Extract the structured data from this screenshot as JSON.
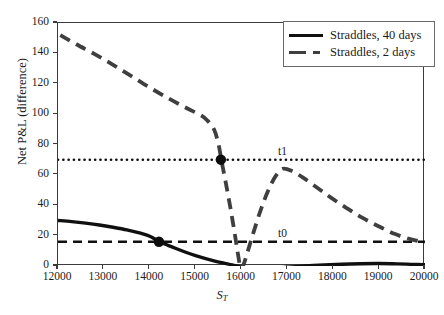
{
  "chart_data": {
    "type": "line",
    "title": "",
    "xlabel": "S_T",
    "xlabel_base": "S",
    "xlabel_sub": "T",
    "ylabel": "Net P&L (difference)",
    "xlim": [
      12000,
      20000
    ],
    "ylim": [
      0,
      160
    ],
    "xticks": [
      12000,
      13000,
      14000,
      15000,
      16000,
      17000,
      18000,
      19000,
      20000
    ],
    "yticks": [
      0,
      20,
      40,
      60,
      80,
      100,
      120,
      140,
      160
    ],
    "grid": false,
    "legend_position": "top-right",
    "series": [
      {
        "name": "Straddles, 40 days",
        "style": "solid",
        "color": "#101010",
        "width": 3.4,
        "points": [
          [
            12000,
            30.0
          ],
          [
            12300,
            29.2
          ],
          [
            12600,
            28.2
          ],
          [
            12900,
            27.0
          ],
          [
            13200,
            25.5
          ],
          [
            13500,
            23.8
          ],
          [
            13800,
            21.6
          ],
          [
            14000,
            19.6
          ],
          [
            14200,
            16.2
          ],
          [
            14400,
            13.6
          ],
          [
            14600,
            11.2
          ],
          [
            14800,
            8.9
          ],
          [
            15000,
            6.8
          ],
          [
            15200,
            5.0
          ],
          [
            15400,
            3.4
          ],
          [
            15600,
            2.0
          ],
          [
            15800,
            0.7
          ],
          [
            16000,
            -0.8
          ],
          [
            16200,
            -1.6
          ],
          [
            16400,
            -1.9
          ],
          [
            16600,
            -1.7
          ],
          [
            16800,
            -1.3
          ],
          [
            17000,
            -0.8
          ],
          [
            17400,
            0.0
          ],
          [
            17800,
            0.7
          ],
          [
            18200,
            1.2
          ],
          [
            18600,
            1.5
          ],
          [
            19000,
            1.6
          ],
          [
            19400,
            1.4
          ],
          [
            19700,
            1.1
          ],
          [
            20000,
            0.8
          ]
        ]
      },
      {
        "name": "Straddles, 2 days",
        "style": "dashed",
        "color": "#3f3f3f",
        "width": 3.8,
        "points": [
          [
            12050,
            152.0
          ],
          [
            12400,
            146.0
          ],
          [
            12800,
            139.5
          ],
          [
            13200,
            132.5
          ],
          [
            13600,
            125.0
          ],
          [
            14000,
            117.5
          ],
          [
            14400,
            110.5
          ],
          [
            14800,
            104.0
          ],
          [
            15100,
            99.5
          ],
          [
            15250,
            96.0
          ],
          [
            15400,
            90.0
          ],
          [
            15500,
            80.0
          ],
          [
            15560,
            70.0
          ],
          [
            15650,
            56.0
          ],
          [
            15760,
            38.0
          ],
          [
            15870,
            18.0
          ],
          [
            15960,
            1.0
          ],
          [
            15990,
            -1.5
          ],
          [
            16040,
            0.5
          ],
          [
            16120,
            8.0
          ],
          [
            16260,
            22.0
          ],
          [
            16420,
            37.0
          ],
          [
            16580,
            49.5
          ],
          [
            16740,
            59.0
          ],
          [
            16900,
            64.0
          ],
          [
            17100,
            62.5
          ],
          [
            17350,
            58.0
          ],
          [
            17650,
            51.5
          ],
          [
            17950,
            45.0
          ],
          [
            18300,
            38.0
          ],
          [
            18650,
            31.5
          ],
          [
            19000,
            26.0
          ],
          [
            19350,
            21.0
          ],
          [
            19700,
            17.5
          ],
          [
            20000,
            15.8
          ]
        ]
      }
    ],
    "reference_lines": [
      {
        "label": "t1",
        "value": 70,
        "style": "dotted",
        "color": "#101010"
      },
      {
        "label": "t0",
        "value": 16,
        "style": "dashed",
        "color": "#101010"
      }
    ],
    "markers": [
      {
        "x": 14200,
        "y": 16.0,
        "series": "Straddles, 40 days"
      },
      {
        "x": 15550,
        "y": 70.0,
        "series": "Straddles, 2 days"
      }
    ]
  },
  "legend": {
    "items": [
      {
        "label": "Straddles, 40 days",
        "style": "solid"
      },
      {
        "label": "Straddles, 2 days",
        "style": "dashed"
      }
    ]
  }
}
